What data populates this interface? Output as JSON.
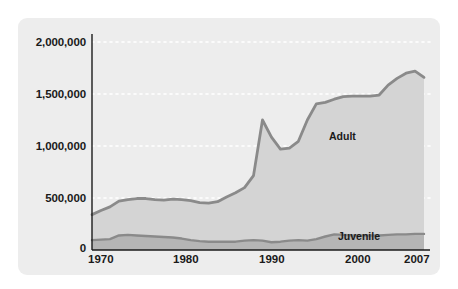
{
  "chart_data": {
    "type": "area",
    "title": "",
    "subtitle": "",
    "xlabel": "",
    "ylabel": "",
    "stacked": true,
    "grid": true,
    "grid_style": "dotted-white-horizontal",
    "legend_position": "inline-annotation",
    "xlim": [
      1970,
      2007
    ],
    "ylim": [
      0,
      2000000
    ],
    "yticks": [
      0,
      500000,
      1000000,
      1500000,
      2000000
    ],
    "ytick_labels": [
      "0",
      "500,000",
      "1,000,000",
      "1,500,000",
      "2,000,000"
    ],
    "xticks": [
      1970,
      1980,
      1990,
      2000,
      2007
    ],
    "xtick_labels": [
      "1970",
      "1980",
      "1990",
      "2000",
      "2007"
    ],
    "colors": {
      "adult_fill": "#d4d4d4",
      "juvenile_fill": "#b5b5b5",
      "line": "#8a8a8a",
      "panel_background": "#ededed",
      "gridline": "#ffffff",
      "text": "#1a1a1a"
    },
    "x": [
      1970,
      1971,
      1972,
      1973,
      1974,
      1975,
      1976,
      1977,
      1978,
      1979,
      1980,
      1981,
      1982,
      1983,
      1984,
      1985,
      1986,
      1987,
      1988,
      1989,
      1990,
      1991,
      1992,
      1993,
      1994,
      1995,
      1996,
      1997,
      1998,
      1999,
      2000,
      2001,
      2002,
      2003,
      2004,
      2005,
      2006,
      2007
    ],
    "series": [
      {
        "name": "Juvenile",
        "label": "Juvenile",
        "values": [
          95000,
          100000,
          105000,
          140000,
          145000,
          140000,
          135000,
          130000,
          125000,
          120000,
          110000,
          95000,
          85000,
          80000,
          80000,
          80000,
          80000,
          90000,
          95000,
          90000,
          75000,
          80000,
          90000,
          95000,
          90000,
          105000,
          130000,
          150000,
          145000,
          140000,
          140000,
          140000,
          140000,
          145000,
          150000,
          150000,
          155000,
          155000
        ]
      },
      {
        "name": "Adult",
        "label": "Adult",
        "values": [
          245000,
          280000,
          310000,
          330000,
          340000,
          355000,
          360000,
          355000,
          355000,
          370000,
          375000,
          380000,
          370000,
          370000,
          385000,
          430000,
          470000,
          510000,
          620000,
          1160000,
          1010000,
          890000,
          890000,
          950000,
          1160000,
          1300000,
          1290000,
          1300000,
          1330000,
          1340000,
          1340000,
          1340000,
          1350000,
          1440000,
          1500000,
          1550000,
          1565000,
          1505000
        ]
      }
    ],
    "totals": [
      340000,
      380000,
      415000,
      470000,
      485000,
      495000,
      495000,
      485000,
      480000,
      490000,
      485000,
      475000,
      455000,
      450000,
      465000,
      510000,
      550000,
      600000,
      715000,
      1250000,
      1085000,
      970000,
      980000,
      1045000,
      1250000,
      1405000,
      1420000,
      1450000,
      1475000,
      1480000,
      1480000,
      1480000,
      1490000,
      1585000,
      1650000,
      1700000,
      1720000,
      1660000
    ]
  },
  "annotations": {
    "adult": "Adult",
    "juvenile": "Juvenile"
  }
}
